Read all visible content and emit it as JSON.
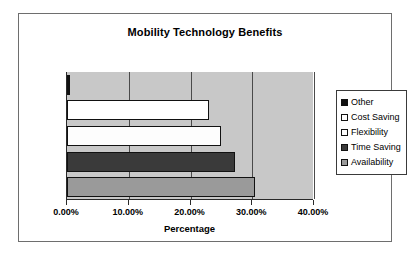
{
  "chart_data": {
    "type": "bar",
    "orientation": "horizontal",
    "title": "Mobility Technology Benefits",
    "xlabel": "Percentage",
    "ylabel": "",
    "xlim": [
      0,
      40
    ],
    "xtick_labels": [
      "0.00%",
      "10.00%",
      "20.00%",
      "30.00%",
      "40.00%"
    ],
    "xticks": [
      0,
      10,
      20,
      30,
      40
    ],
    "grid": true,
    "legend_position": "right",
    "categories": [
      "Availability",
      "Time Saving",
      "Flexibility",
      "Cost Saving",
      "Other"
    ],
    "values": [
      30.5,
      27.2,
      25.0,
      23.0,
      0.5
    ],
    "series": [
      {
        "name": "Other",
        "value": 0.5,
        "color": "#111111",
        "swatch_icon": "filled-square-black"
      },
      {
        "name": "Cost Saving",
        "value": 23.0,
        "color": "#ffffff",
        "swatch_icon": "empty-square-white"
      },
      {
        "name": "Flexibility",
        "value": 25.0,
        "color": "#fdfdfd",
        "swatch_icon": "empty-square-white"
      },
      {
        "name": "Time Saving",
        "value": 27.2,
        "color": "#3a3a3a",
        "swatch_icon": "filled-square-dark-gray"
      },
      {
        "name": "Availability",
        "value": 30.5,
        "color": "#9a9a9a",
        "swatch_icon": "filled-square-gray"
      }
    ],
    "plot_background": "#c8c8c8",
    "frame_color": "#6e6e6e"
  }
}
